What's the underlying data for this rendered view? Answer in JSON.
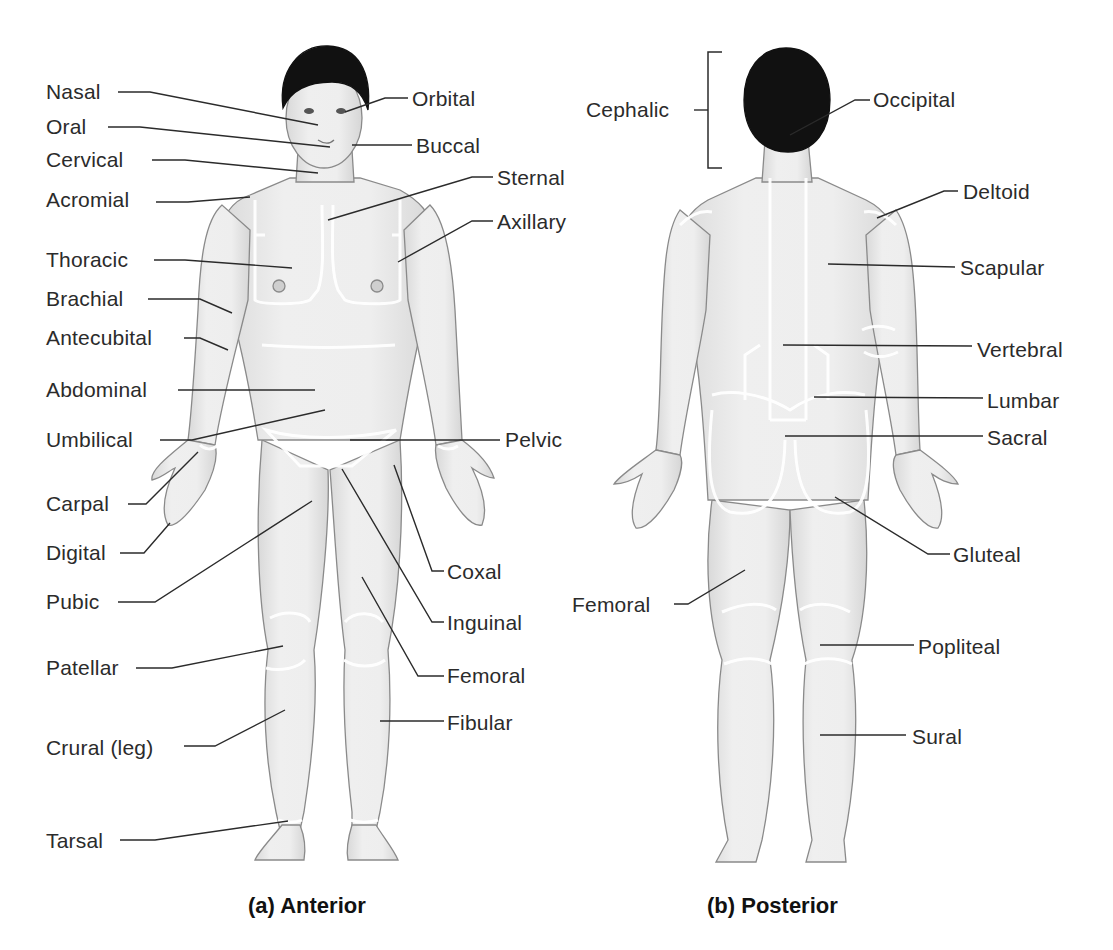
{
  "figure": {
    "colors": {
      "skin_fill": "#ececec",
      "skin_shade": "#d6d6d6",
      "outline": "#8a8a8a",
      "hair": "#111111",
      "region_border": "#ffffff",
      "leader_line": "#2b2b2b",
      "label_text": "#2b2b2b"
    },
    "anterior": {
      "caption": "(a) Anterior",
      "caption_pos": [
        248,
        905
      ],
      "labels": [
        {
          "text": "Nasal",
          "x": 46,
          "y": 80,
          "line": [
            [
              118,
              92
            ],
            [
              150,
              92
            ],
            [
              318,
              125
            ]
          ]
        },
        {
          "text": "Oral",
          "x": 46,
          "y": 115,
          "line": [
            [
              108,
              127
            ],
            [
              140,
              127
            ],
            [
              330,
              147
            ]
          ]
        },
        {
          "text": "Cervical",
          "x": 46,
          "y": 148,
          "line": [
            [
              152,
              160
            ],
            [
              185,
              160
            ],
            [
              318,
              173
            ]
          ]
        },
        {
          "text": "Acromial",
          "x": 46,
          "y": 188,
          "line": [
            [
              156,
              202
            ],
            [
              188,
              202
            ],
            [
              250,
              197
            ]
          ]
        },
        {
          "text": "Thoracic",
          "x": 46,
          "y": 248,
          "line": [
            [
              154,
              260
            ],
            [
              185,
              260
            ],
            [
              292,
              268
            ]
          ]
        },
        {
          "text": "Brachial",
          "x": 46,
          "y": 287,
          "line": [
            [
              148,
              299
            ],
            [
              200,
              299
            ],
            [
              232,
              313
            ]
          ]
        },
        {
          "text": "Antecubital",
          "x": 46,
          "y": 326,
          "line": [
            [
              184,
              338
            ],
            [
              200,
              338
            ],
            [
              228,
              350
            ]
          ]
        },
        {
          "text": "Abdominal",
          "x": 46,
          "y": 378,
          "line": [
            [
              178,
              390
            ],
            [
              315,
              390
            ]
          ]
        },
        {
          "text": "Umbilical",
          "x": 46,
          "y": 428,
          "line": [
            [
              160,
              440
            ],
            [
              192,
              440
            ],
            [
              325,
              410
            ]
          ]
        },
        {
          "text": "Carpal",
          "x": 46,
          "y": 492,
          "line": [
            [
              128,
              504
            ],
            [
              146,
              504
            ],
            [
              198,
              452
            ]
          ]
        },
        {
          "text": "Digital",
          "x": 46,
          "y": 541,
          "line": [
            [
              120,
              553
            ],
            [
              144,
              553
            ],
            [
              170,
              523
            ]
          ]
        },
        {
          "text": "Pubic",
          "x": 46,
          "y": 590,
          "line": [
            [
              118,
              602
            ],
            [
              155,
              602
            ],
            [
              312,
              501
            ]
          ]
        },
        {
          "text": "Patellar",
          "x": 46,
          "y": 656,
          "line": [
            [
              136,
              668
            ],
            [
              172,
              668
            ],
            [
              283,
              646
            ]
          ]
        },
        {
          "text": "Crural (leg)",
          "x": 46,
          "y": 736,
          "line": [
            [
              184,
              746
            ],
            [
              215,
              746
            ],
            [
              285,
              710
            ]
          ]
        },
        {
          "text": "Tarsal",
          "x": 46,
          "y": 829,
          "line": [
            [
              120,
              840
            ],
            [
              155,
              840
            ],
            [
              288,
              821
            ]
          ]
        },
        {
          "text": "Orbital",
          "x": 412,
          "y": 87,
          "line": [
            [
              408,
              98
            ],
            [
              385,
              98
            ],
            [
              345,
              112
            ]
          ]
        },
        {
          "text": "Buccal",
          "x": 416,
          "y": 134,
          "line": [
            [
              412,
              145
            ],
            [
              352,
              145
            ]
          ]
        },
        {
          "text": "Steral_placeholder",
          "x": 0,
          "y": 0,
          "line": [],
          "hidden": true
        },
        {
          "text": "Sternal",
          "x": 497,
          "y": 166,
          "line": [
            [
              493,
              177
            ],
            [
              472,
              177
            ],
            [
              328,
              220
            ]
          ]
        },
        {
          "text": "Axillary",
          "x": 497,
          "y": 210,
          "line": [
            [
              493,
              221
            ],
            [
              472,
              221
            ],
            [
              398,
              262
            ]
          ]
        },
        {
          "text": "Pelvic",
          "x": 505,
          "y": 428,
          "line": [
            [
              500,
              440
            ],
            [
              350,
              440
            ]
          ]
        },
        {
          "text": "Coxal",
          "x": 447,
          "y": 560,
          "line": [
            [
              444,
              571
            ],
            [
              432,
              571
            ],
            [
              394,
              465
            ]
          ]
        },
        {
          "text": "Inguinal",
          "x": 447,
          "y": 611,
          "line": [
            [
              444,
              622
            ],
            [
              432,
              622
            ],
            [
              342,
              469
            ]
          ]
        },
        {
          "text": "Femoral",
          "x": 447,
          "y": 664,
          "line": [
            [
              444,
              676
            ],
            [
              418,
              676
            ],
            [
              362,
              577
            ]
          ]
        },
        {
          "text": "Fibular",
          "x": 447,
          "y": 711,
          "line": [
            [
              444,
              721
            ],
            [
              380,
              721
            ]
          ]
        }
      ]
    },
    "posterior": {
      "caption": "(b) Posterior",
      "caption_pos": [
        707,
        905
      ],
      "labels": [
        {
          "text": "Cephalic",
          "x": 586,
          "y": 98,
          "line": [
            [
              694,
              110
            ],
            [
              708,
              110
            ]
          ]
        },
        {
          "text": "Occipital",
          "x": 873,
          "y": 88,
          "line": [
            [
              870,
              100
            ],
            [
              855,
              100
            ],
            [
              790,
              135
            ]
          ]
        },
        {
          "text": "Deltoid",
          "x": 963,
          "y": 180,
          "line": [
            [
              958,
              191
            ],
            [
              944,
              191
            ],
            [
              877,
              218
            ]
          ]
        },
        {
          "text": "Scapular",
          "x": 960,
          "y": 256,
          "line": [
            [
              955,
              267
            ],
            [
              828,
              264
            ]
          ]
        },
        {
          "text": "Vertebral",
          "x": 977,
          "y": 338,
          "line": [
            [
              972,
              346
            ],
            [
              783,
              345
            ]
          ]
        },
        {
          "text": "Lumbar",
          "x": 987,
          "y": 389,
          "line": [
            [
              983,
              398
            ],
            [
              814,
              397
            ]
          ]
        },
        {
          "text": "Sacral",
          "x": 987,
          "y": 426,
          "line": [
            [
              983,
              436
            ],
            [
              785,
              436
            ]
          ]
        },
        {
          "text": "Gluteal",
          "x": 953,
          "y": 543,
          "line": [
            [
              950,
              554
            ],
            [
              928,
              554
            ],
            [
              835,
              497
            ]
          ]
        },
        {
          "text": "Femoral",
          "x": 572,
          "y": 593,
          "line": [
            [
              674,
              604
            ],
            [
              688,
              604
            ],
            [
              745,
              570
            ]
          ]
        },
        {
          "text": "Popliteal",
          "x": 918,
          "y": 635,
          "line": [
            [
              914,
              645
            ],
            [
              820,
              645
            ]
          ]
        },
        {
          "text": "Sural",
          "x": 912,
          "y": 725,
          "line": [
            [
              906,
              735
            ],
            [
              820,
              735
            ]
          ]
        }
      ]
    }
  }
}
